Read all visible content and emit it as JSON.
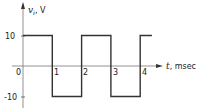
{
  "chart_data": {
    "type": "line",
    "title": "",
    "xlabel": "t, msec",
    "ylabel": "v_i, V",
    "ylabel_var": "v",
    "ylabel_sub": "i",
    "ylabel_unit": ", V",
    "xlabel_var": "t",
    "xlabel_unit": ", msec",
    "x_ticks": [
      "0",
      "1",
      "2",
      "3",
      "4"
    ],
    "y_ticks": [
      "10",
      "-10"
    ],
    "xlim": [
      0,
      4.4
    ],
    "ylim": [
      -12,
      20
    ],
    "grid": false,
    "series": [
      {
        "name": "v_i (square wave)",
        "x": [
          0,
          1,
          1,
          2,
          2,
          3,
          3,
          4,
          4,
          4.4
        ],
        "values": [
          10,
          10,
          -10,
          -10,
          10,
          10,
          -10,
          -10,
          10,
          10
        ]
      }
    ],
    "period_ms": 2,
    "amplitude_V": 10
  }
}
